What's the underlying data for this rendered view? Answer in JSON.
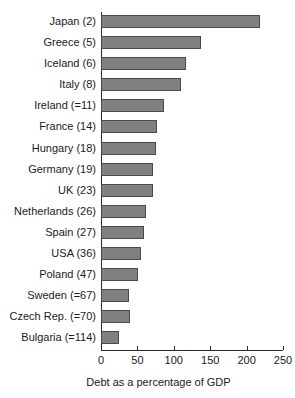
{
  "artifact": {
    "clipped_text": " "
  },
  "chart_data": {
    "type": "bar",
    "orientation": "horizontal",
    "title": "",
    "subtitle": "",
    "xlabel": "Debt as a percentage of GDP",
    "ylabel": "",
    "xlim": [
      0,
      250
    ],
    "xticks": [
      0,
      50,
      100,
      150,
      200,
      250
    ],
    "xtick_labels": [
      "0",
      "50",
      "100",
      "150",
      "200",
      "250"
    ],
    "grid": false,
    "legend": null,
    "bar_color": "#808080",
    "bar_edge_color": "#4a4a4a",
    "axis_color": "#2b2b2b",
    "categories": [
      "Japan (2)",
      "Greece (5)",
      "Iceland (6)",
      "Italy (8)",
      "Ireland (=11)",
      "France (14)",
      "Hungary (18)",
      "Germany (19)",
      "UK (23)",
      "Netherlands (26)",
      "Spain (27)",
      "USA (36)",
      "Poland (47)",
      "Sweden (=67)",
      "Czech Rep. (=70)",
      "Bulgaria (=114)"
    ],
    "values": [
      218,
      138,
      117,
      110,
      86,
      77,
      75,
      71,
      72,
      62,
      59,
      55,
      51,
      39,
      40,
      25
    ]
  }
}
